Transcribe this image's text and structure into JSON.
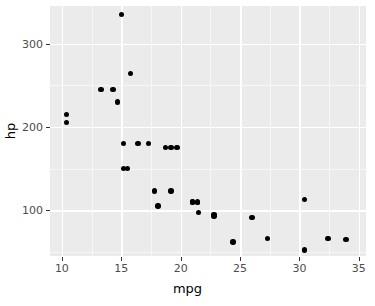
{
  "chart_data": {
    "type": "scatter",
    "title": "",
    "xlabel": "mpg",
    "ylabel": "hp",
    "xlim": [
      9.0,
      35.6
    ],
    "ylim": [
      45,
      345
    ],
    "x_ticks": [
      10,
      15,
      20,
      25,
      30,
      35
    ],
    "y_ticks": [
      100,
      200,
      300
    ],
    "x_tick_labels": [
      "10",
      "15",
      "20",
      "25",
      "30",
      "35"
    ],
    "y_tick_labels": [
      "100",
      "200",
      "300"
    ],
    "x_minor_ticks": [
      12.5,
      17.5,
      22.5,
      27.5,
      32.5
    ],
    "y_minor_ticks": [
      50,
      150,
      250,
      300
    ],
    "grid": true,
    "legend": false,
    "panel_background": "#ebebeb",
    "grid_color": "#ffffff",
    "point_color": "#000000",
    "point_size": 5.4,
    "series": [
      {
        "name": "mtcars",
        "points": [
          {
            "x": 21.0,
            "y": 110
          },
          {
            "x": 21.0,
            "y": 110
          },
          {
            "x": 22.8,
            "y": 93
          },
          {
            "x": 21.4,
            "y": 110
          },
          {
            "x": 18.7,
            "y": 175
          },
          {
            "x": 18.1,
            "y": 105
          },
          {
            "x": 14.3,
            "y": 245
          },
          {
            "x": 24.4,
            "y": 62
          },
          {
            "x": 22.8,
            "y": 95
          },
          {
            "x": 19.2,
            "y": 123
          },
          {
            "x": 17.8,
            "y": 123
          },
          {
            "x": 16.4,
            "y": 180
          },
          {
            "x": 17.3,
            "y": 180
          },
          {
            "x": 15.2,
            "y": 180
          },
          {
            "x": 10.4,
            "y": 205
          },
          {
            "x": 10.4,
            "y": 215
          },
          {
            "x": 14.7,
            "y": 230
          },
          {
            "x": 32.4,
            "y": 66
          },
          {
            "x": 30.4,
            "y": 52
          },
          {
            "x": 33.9,
            "y": 65
          },
          {
            "x": 21.5,
            "y": 97
          },
          {
            "x": 15.5,
            "y": 150
          },
          {
            "x": 15.2,
            "y": 150
          },
          {
            "x": 13.3,
            "y": 245
          },
          {
            "x": 19.2,
            "y": 175
          },
          {
            "x": 27.3,
            "y": 66
          },
          {
            "x": 26.0,
            "y": 91
          },
          {
            "x": 30.4,
            "y": 113
          },
          {
            "x": 15.8,
            "y": 264
          },
          {
            "x": 19.7,
            "y": 175
          },
          {
            "x": 15.0,
            "y": 335
          },
          {
            "x": 21.4,
            "y": 109
          }
        ]
      }
    ]
  },
  "axes": {
    "x_title": "mpg",
    "y_title": "hp"
  }
}
